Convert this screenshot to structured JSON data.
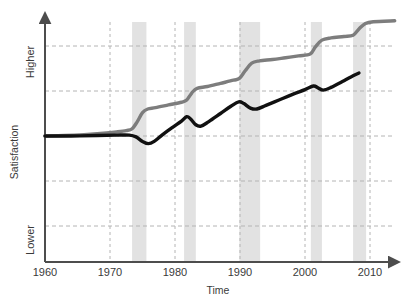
{
  "chart_data": {
    "type": "line",
    "title": "",
    "xlabel": "Time",
    "ylabel": "Satisfaction",
    "xlim": [
      1960,
      2014
    ],
    "ylim": [
      0,
      5
    ],
    "grid": true,
    "legend": "none",
    "xticks": [
      1960,
      1970,
      1980,
      1990,
      2000,
      2010
    ],
    "xtick_labels": [
      "1960",
      "1970",
      "1980",
      "1990",
      "2000",
      "2010"
    ],
    "ytick_labels_shown": [
      "Lower",
      "Higher"
    ],
    "y_low_label": "Lower",
    "y_high_label": "Higher",
    "y_gridlines": [
      1,
      2,
      3,
      4,
      5
    ],
    "colors": {
      "series_upper": "#7d7d7d",
      "series_lower": "#111111",
      "recession_band": "#e2e2e2",
      "gridline": "#b4b4b4",
      "axis": "#4d4d4d"
    },
    "recession_bands": [
      {
        "start": 1973.4,
        "end": 1975.6
      },
      {
        "start": 1981.4,
        "end": 1983.2
      },
      {
        "start": 1989.9,
        "end": 1993.1
      },
      {
        "start": 2000.9,
        "end": 2002.6
      },
      {
        "start": 2007.4,
        "end": 2009.4
      }
    ],
    "series": [
      {
        "name": "series_upper",
        "color": "#7d7d7d",
        "points": [
          [
            1960.0,
            3.0
          ],
          [
            1963.0,
            3.01
          ],
          [
            1966.0,
            3.03
          ],
          [
            1969.0,
            3.06
          ],
          [
            1971.0,
            3.09
          ],
          [
            1972.5,
            3.12
          ],
          [
            1973.4,
            3.16
          ],
          [
            1974.2,
            3.32
          ],
          [
            1975.0,
            3.52
          ],
          [
            1975.8,
            3.6
          ],
          [
            1977.0,
            3.63
          ],
          [
            1979.0,
            3.69
          ],
          [
            1981.0,
            3.75
          ],
          [
            1981.8,
            3.8
          ],
          [
            1982.6,
            3.96
          ],
          [
            1983.4,
            4.06
          ],
          [
            1985.0,
            4.1
          ],
          [
            1987.0,
            4.17
          ],
          [
            1989.0,
            4.24
          ],
          [
            1989.9,
            4.28
          ],
          [
            1990.8,
            4.45
          ],
          [
            1991.8,
            4.62
          ],
          [
            1993.0,
            4.67
          ],
          [
            1995.0,
            4.7
          ],
          [
            1997.0,
            4.74
          ],
          [
            1999.0,
            4.78
          ],
          [
            2000.8,
            4.82
          ],
          [
            2001.6,
            4.98
          ],
          [
            2002.6,
            5.13
          ],
          [
            2004.0,
            5.18
          ],
          [
            2006.0,
            5.21
          ],
          [
            2007.4,
            5.24
          ],
          [
            2008.3,
            5.38
          ],
          [
            2009.3,
            5.5
          ],
          [
            2010.5,
            5.54
          ],
          [
            2013.8,
            5.56
          ]
        ]
      },
      {
        "name": "series_lower",
        "color": "#111111",
        "points": [
          [
            1960.0,
            3.0
          ],
          [
            1964.0,
            3.0
          ],
          [
            1968.0,
            3.01
          ],
          [
            1971.0,
            3.02
          ],
          [
            1973.0,
            3.02
          ],
          [
            1974.0,
            2.98
          ],
          [
            1975.0,
            2.88
          ],
          [
            1975.9,
            2.83
          ],
          [
            1976.8,
            2.88
          ],
          [
            1978.0,
            3.02
          ],
          [
            1979.5,
            3.18
          ],
          [
            1981.0,
            3.33
          ],
          [
            1981.8,
            3.43
          ],
          [
            1982.4,
            3.38
          ],
          [
            1983.2,
            3.25
          ],
          [
            1984.0,
            3.22
          ],
          [
            1985.2,
            3.32
          ],
          [
            1987.0,
            3.5
          ],
          [
            1988.6,
            3.66
          ],
          [
            1989.8,
            3.76
          ],
          [
            1990.6,
            3.72
          ],
          [
            1991.6,
            3.62
          ],
          [
            1992.6,
            3.6
          ],
          [
            1994.0,
            3.68
          ],
          [
            1996.0,
            3.8
          ],
          [
            1998.0,
            3.92
          ],
          [
            2000.0,
            4.03
          ],
          [
            2001.3,
            4.11
          ],
          [
            2002.0,
            4.07
          ],
          [
            2002.8,
            4.02
          ],
          [
            2004.0,
            4.08
          ],
          [
            2006.0,
            4.23
          ],
          [
            2007.4,
            4.34
          ],
          [
            2008.3,
            4.4
          ]
        ]
      }
    ]
  },
  "axis": {
    "x_title": "Time",
    "y_title": "Satisfaction",
    "y_top_label": "Higher",
    "y_bottom_label": "Lower",
    "x_tick_1": "1960",
    "x_tick_2": "1970",
    "x_tick_3": "1980",
    "x_tick_4": "1990",
    "x_tick_5": "2000",
    "x_tick_6": "2010"
  }
}
